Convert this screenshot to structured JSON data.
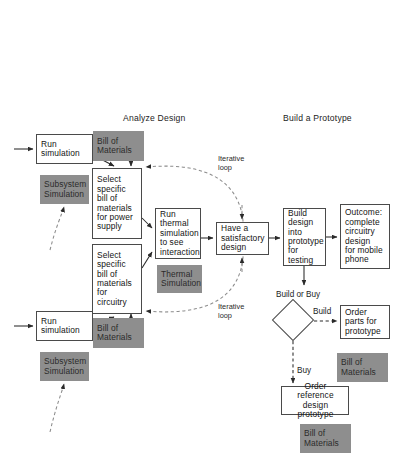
{
  "diagram": {
    "background_color": "#ffffff",
    "box_border_color": "#4a4a4a",
    "gray_fill_color": "#8e8e8e",
    "text_color": "#141414"
  },
  "headers": [
    {
      "id": "analyze",
      "label": "Analyze Design",
      "x": 123,
      "y": 113
    },
    {
      "id": "prototype",
      "label": "Build a Prototype",
      "x": 283,
      "y": 113
    }
  ],
  "nodes": [
    {
      "id": "run-sim-top",
      "label": "Run\nsimulation",
      "shape": "box",
      "x": 36,
      "y": 134,
      "w": 57,
      "h": 30,
      "align": "left"
    },
    {
      "id": "bom-top",
      "label": "Bill of\nMaterials",
      "shape": "gray",
      "x": 93,
      "y": 131,
      "w": 51,
      "h": 30,
      "align": "left"
    },
    {
      "id": "subsystem-top",
      "label": "Subsystem\nSimulation",
      "shape": "gray",
      "x": 40,
      "y": 175,
      "w": 49,
      "h": 29,
      "align": "left"
    },
    {
      "id": "select-power",
      "label": "Select\nspecific\nbill of\nmaterials\nfor power\nsupply",
      "shape": "box",
      "x": 92,
      "y": 168,
      "w": 50,
      "h": 71,
      "align": "left"
    },
    {
      "id": "select-circuitry",
      "label": "Select\nspecific\nbill of\nmaterials\nfor\ncircuitry",
      "shape": "box",
      "x": 92,
      "y": 244,
      "w": 50,
      "h": 70,
      "align": "left"
    },
    {
      "id": "run-thermal",
      "label": "Run\nthermal\nsimulation\nto see\ninteraction",
      "shape": "box",
      "x": 155,
      "y": 208,
      "w": 46,
      "h": 51,
      "align": "left"
    },
    {
      "id": "thermal-sim",
      "label": "Thermal\nSimulation",
      "shape": "gray",
      "x": 157,
      "y": 265,
      "w": 45,
      "h": 28,
      "align": "left"
    },
    {
      "id": "run-sim-bottom",
      "label": "Run\nsimulation",
      "shape": "box",
      "x": 36,
      "y": 311,
      "w": 57,
      "h": 30,
      "align": "left"
    },
    {
      "id": "bom-bottom-left",
      "label": "Bill of\nMaterials",
      "shape": "gray",
      "x": 93,
      "y": 318,
      "w": 51,
      "h": 30,
      "align": "left"
    },
    {
      "id": "subsystem-bottom",
      "label": "Subsystem\nSimulation",
      "shape": "gray",
      "x": 40,
      "y": 352,
      "w": 49,
      "h": 29,
      "align": "left"
    },
    {
      "id": "satisfactory",
      "label": "Have a\nsatisfactory\ndesign",
      "shape": "box",
      "x": 216,
      "y": 222,
      "w": 53,
      "h": 33,
      "align": "left"
    },
    {
      "id": "build-design",
      "label": "Build\ndesign\ninto\nprototype\nfor testing",
      "shape": "box",
      "x": 283,
      "y": 208,
      "w": 43,
      "h": 58,
      "align": "left"
    },
    {
      "id": "outcome",
      "label": "Outcome:\ncomplete\ncircuitry\ndesign\nfor mobile\nphone",
      "shape": "box",
      "x": 340,
      "y": 204,
      "w": 50,
      "h": 65,
      "align": "left"
    },
    {
      "id": "order-parts",
      "label": "Order\nparts for\nprototype",
      "shape": "box",
      "x": 340,
      "y": 305,
      "w": 50,
      "h": 34,
      "align": "left"
    },
    {
      "id": "bom-order-parts",
      "label": "Bill of\nMaterials",
      "shape": "gray",
      "x": 337,
      "y": 353,
      "w": 51,
      "h": 29,
      "align": "left"
    },
    {
      "id": "order-reference",
      "label": "Order reference\ndesign prototype",
      "shape": "box",
      "x": 281,
      "y": 386,
      "w": 68,
      "h": 29,
      "align": "left"
    },
    {
      "id": "bom-reference",
      "label": "Bill of\nMaterials",
      "shape": "gray",
      "x": 300,
      "y": 424,
      "w": 51,
      "h": 29,
      "align": "left"
    }
  ],
  "decision": {
    "id": "build-or-buy",
    "caption": "Build or Buy",
    "caption_x": 276,
    "caption_y": 290,
    "cx": 293,
    "cy": 320,
    "size": 30
  },
  "edge_labels": [
    {
      "id": "iterative-loop-top",
      "label": "Iterative\nloop",
      "x": 218,
      "y": 155
    },
    {
      "id": "iterative-loop-bottom",
      "label": "Iterative\nloop",
      "x": 218,
      "y": 303
    },
    {
      "id": "branch-build",
      "label": "Build",
      "x": 313,
      "y": 307
    },
    {
      "id": "branch-buy",
      "label": "Buy",
      "x": 297,
      "y": 368
    }
  ]
}
